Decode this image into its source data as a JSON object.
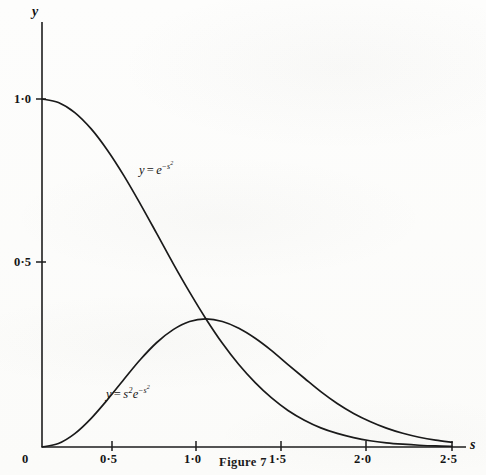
{
  "figure": {
    "caption": "Figure 7",
    "x_axis_name": "s",
    "y_axis_name": "y"
  },
  "labels": {
    "gaussian": {
      "lhs": "y",
      "op": "=",
      "base": "e",
      "exponent_sign": "−",
      "exponent_var": "s",
      "exponent_power": "2"
    },
    "s2gaussian": {
      "lhs": "y",
      "op": "=",
      "factor_var": "s",
      "factor_power": "2",
      "base": "e",
      "exponent_sign": "−",
      "exponent_var": "s",
      "exponent_power": "2"
    }
  },
  "axis_ticks": {
    "x": [
      "0",
      "0·5",
      "1·0",
      "1·5",
      "2·0",
      "2·5"
    ],
    "y": [
      "0",
      "0·5",
      "1·0"
    ]
  },
  "chart_data": {
    "type": "line",
    "title": "Figure 7",
    "xlabel": "s",
    "ylabel": "y",
    "xlim": [
      0,
      2.5
    ],
    "ylim": [
      0,
      1.15
    ],
    "xticks": [
      0,
      0.5,
      1.0,
      1.5,
      2.0,
      2.5
    ],
    "xticklabels": [
      "0",
      "0·5",
      "1·0",
      "1·5",
      "2·0",
      "2·5"
    ],
    "yticks": [
      0,
      0.5,
      1.0
    ],
    "yticklabels": [
      "0",
      "0·5",
      "1·0"
    ],
    "grid": false,
    "legend": "inline-curve-labels",
    "series": [
      {
        "name": "y = e^(-s^2)",
        "label_text": "y = e⁻ˢ²",
        "color": "#1a1a1a",
        "x": [
          0,
          0.1,
          0.2,
          0.3,
          0.4,
          0.5,
          0.6,
          0.7,
          0.8,
          0.9,
          1.0,
          1.1,
          1.2,
          1.3,
          1.4,
          1.5,
          1.6,
          1.7,
          1.8,
          1.9,
          2.0,
          2.1,
          2.2,
          2.3,
          2.4,
          2.5
        ],
        "values": [
          1.0,
          0.99,
          0.961,
          0.914,
          0.852,
          0.779,
          0.698,
          0.613,
          0.527,
          0.445,
          0.368,
          0.298,
          0.237,
          0.185,
          0.141,
          0.105,
          0.077,
          0.055,
          0.039,
          0.027,
          0.018,
          0.012,
          0.008,
          0.005,
          0.003,
          0.002
        ]
      },
      {
        "name": "y = s^2 e^(-s^2)",
        "label_text": "y = s²e⁻ˢ²",
        "color": "#1a1a1a",
        "x": [
          0,
          0.1,
          0.2,
          0.3,
          0.4,
          0.5,
          0.6,
          0.7,
          0.8,
          0.9,
          1.0,
          1.1,
          1.2,
          1.3,
          1.4,
          1.5,
          1.6,
          1.7,
          1.8,
          1.9,
          2.0,
          2.1,
          2.2,
          2.3,
          2.4,
          2.5
        ],
        "values": [
          0.0,
          0.0099,
          0.0384,
          0.0823,
          0.1363,
          0.1947,
          0.2513,
          0.3003,
          0.3373,
          0.3606,
          0.3679,
          0.3606,
          0.3413,
          0.3126,
          0.2771,
          0.2369,
          0.1976,
          0.159,
          0.1249,
          0.0964,
          0.0733,
          0.0542,
          0.0394,
          0.0281,
          0.0197,
          0.0136
        ]
      }
    ],
    "annotations": [
      {
        "text": "curves intersect at s = 1·0, y ≈ 0·368",
        "x": 1.0,
        "y": 0.368
      },
      {
        "text": "peak of s²e⁻ˢ² at s = 1·0",
        "x": 1.0,
        "y": 0.3679
      }
    ]
  }
}
